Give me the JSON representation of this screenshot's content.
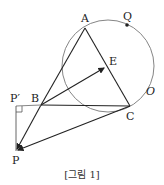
{
  "figure": {
    "caption": "[그림 1]",
    "labels": {
      "A": "A",
      "B": "B",
      "C": "C",
      "E": "E",
      "Q": "Q",
      "O": "O",
      "P": "P",
      "P_prime": "P′"
    },
    "points": {
      "A": [
        85,
        28
      ],
      "B": [
        41,
        105
      ],
      "C": [
        130,
        106
      ],
      "E": [
        106,
        67
      ],
      "Q": [
        127,
        25
      ],
      "P": [
        16,
        151
      ],
      "P_prime": [
        16,
        106
      ]
    },
    "circle": {
      "name": "O",
      "center": [
        108,
        66
      ],
      "radius": 46
    },
    "colors": {
      "lines": "#222222",
      "circle": "#777777"
    }
  }
}
